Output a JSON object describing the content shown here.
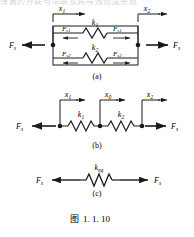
{
  "figure": {
    "caption_prefix": "图",
    "caption_number": "1. 1. 10",
    "clipped_top_text": "弹簧的并联与串联及其等效劲度系数"
  },
  "panels": [
    {
      "id": "a",
      "label": "(a)",
      "type": "parallel",
      "force_left": "F",
      "force_left_sub": "s",
      "force_right": "F",
      "force_right_sub": "s",
      "displacements": [
        {
          "symbol": "x",
          "sub": "1"
        },
        {
          "symbol": "x",
          "sub": "2"
        }
      ],
      "branches": [
        {
          "stiffness": "k",
          "stiffness_sub": "1",
          "force_left": "F",
          "force_left_sub": "s1",
          "force_right": "F",
          "force_right_sub": "s1"
        },
        {
          "stiffness": "k",
          "stiffness_sub": "2",
          "force_left": "F",
          "force_left_sub": "s2",
          "force_right": "F",
          "force_right_sub": "s2"
        }
      ]
    },
    {
      "id": "b",
      "label": "(b)",
      "type": "series",
      "force_left": "F",
      "force_left_sub": "s",
      "force_right": "F",
      "force_right_sub": "s",
      "displacements": [
        {
          "symbol": "x",
          "sub": "1"
        },
        {
          "symbol": "x",
          "sub": "0"
        },
        {
          "symbol": "x",
          "sub": "2"
        }
      ],
      "springs": [
        {
          "stiffness": "k",
          "stiffness_sub": "1"
        },
        {
          "stiffness": "k",
          "stiffness_sub": "2"
        }
      ]
    },
    {
      "id": "c",
      "label": "(c)",
      "type": "equivalent",
      "force_left": "F",
      "force_left_sub": "s",
      "force_right": "F",
      "force_right_sub": "s",
      "springs": [
        {
          "stiffness": "k",
          "stiffness_sub": "eq"
        }
      ]
    }
  ],
  "colors": {
    "ink": "#1a1a1a",
    "background": "#ffffff"
  }
}
